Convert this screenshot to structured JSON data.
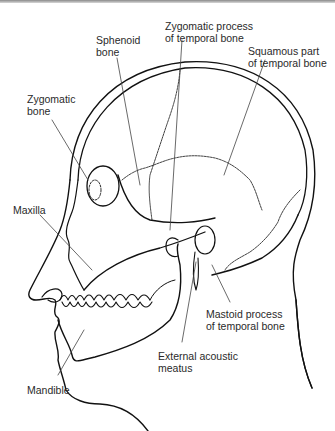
{
  "diagram": {
    "labels": {
      "sphenoid": "Sphenoid\nbone",
      "zygomatic_process": "Zygomatic process\nof temporal bone",
      "squamous": "Squamous part\nof temporal bone",
      "zygomatic_bone": "Zygomatic\nbone",
      "maxilla": "Maxilla",
      "mastoid": "Mastoid process\nof temporal bone",
      "acoustic_meatus": "External acoustic\nmeatus",
      "mandible": "Mandible"
    },
    "colors": {
      "line": "#111111",
      "leader": "#444444",
      "text": "#2a2a2a",
      "background": "#ffffff"
    }
  }
}
